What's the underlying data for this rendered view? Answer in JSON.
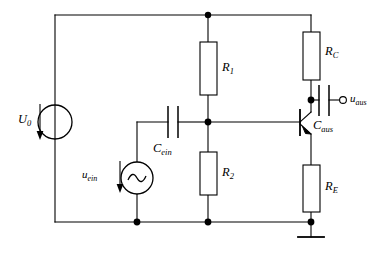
{
  "figure": {
    "type": "electronic-circuit-schematic",
    "line_color": "#000000",
    "background_color": "#ffffff",
    "width": 388,
    "height": 259
  },
  "labels": {
    "u0": {
      "base": "U",
      "sub": "0"
    },
    "uein": {
      "base": "u",
      "sub": "ein"
    },
    "uaus": {
      "base": "u",
      "sub": "aus"
    },
    "cein": {
      "base": "C",
      "sub": "ein"
    },
    "caus": {
      "base": "C",
      "sub": "aus"
    },
    "r1": {
      "base": "R",
      "sub": "1"
    },
    "r2": {
      "base": "R",
      "sub": "2"
    },
    "rc": {
      "base": "R",
      "sub": "C"
    },
    "re": {
      "base": "R",
      "sub": "E"
    }
  },
  "components": [
    {
      "id": "u0",
      "kind": "dc-voltage-source",
      "label": "U0"
    },
    {
      "id": "uein",
      "kind": "ac-voltage-source",
      "label": "uein"
    },
    {
      "id": "cein",
      "kind": "capacitor",
      "label": "Cein"
    },
    {
      "id": "caus",
      "kind": "capacitor",
      "label": "Caus"
    },
    {
      "id": "r1",
      "kind": "resistor",
      "label": "R1"
    },
    {
      "id": "r2",
      "kind": "resistor",
      "label": "R2"
    },
    {
      "id": "rc",
      "kind": "resistor",
      "label": "RC"
    },
    {
      "id": "re",
      "kind": "resistor",
      "label": "RE"
    },
    {
      "id": "q1",
      "kind": "npn-bipolar-transistor",
      "label": ""
    },
    {
      "id": "gnd",
      "kind": "ground",
      "label": ""
    },
    {
      "id": "uaus_terminal",
      "kind": "open-terminal",
      "label": "uaus"
    }
  ]
}
